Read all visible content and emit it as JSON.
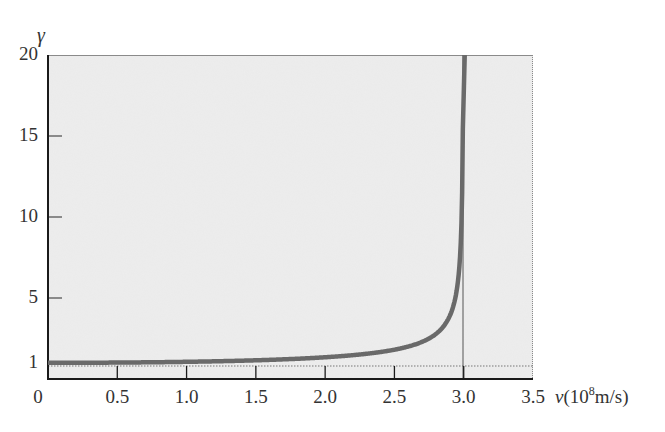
{
  "chart_data": {
    "type": "line",
    "title": "",
    "xlabel": "v(10^8 m/s)",
    "xlabel_parts": {
      "var": "v",
      "open": "(10",
      "exp": "8",
      "rest": "m/s)"
    },
    "ylabel": "γ",
    "xlim": [
      0,
      3.5
    ],
    "ylim": [
      0,
      20
    ],
    "x_ticks": [
      "0",
      "0.5",
      "1.0",
      "1.5",
      "2.0",
      "2.5",
      "3.0",
      "3.5"
    ],
    "y_ticks": [
      "1",
      "5",
      "10",
      "15",
      "20"
    ],
    "grid": false,
    "legend": null,
    "reference_lines": [
      {
        "type": "horizontal",
        "y": 1,
        "style": "dotted"
      },
      {
        "type": "vertical",
        "x": 3.0,
        "style": "thin",
        "label": "c"
      }
    ],
    "series": [
      {
        "name": "gamma = 1/sqrt(1 - v^2/c^2)",
        "x": [
          0,
          0.5,
          1.0,
          1.5,
          2.0,
          2.25,
          2.5,
          2.7,
          2.8,
          2.85,
          2.9,
          2.95,
          2.97,
          2.985,
          2.995
        ],
        "values": [
          1.0,
          1.01,
          1.06,
          1.15,
          1.34,
          1.51,
          1.81,
          2.29,
          2.79,
          3.2,
          3.91,
          5.49,
          7.09,
          10.01,
          17.33
        ]
      }
    ],
    "colors": {
      "background": "#ededed",
      "curve": "#6a6a6a",
      "axis": "#1a1a1a"
    }
  },
  "labels": {
    "y_axis_symbol": "γ",
    "x_tick_labels": [
      "0",
      "0.5",
      "1.0",
      "1.5",
      "2.0",
      "2.5",
      "3.0",
      "3.5"
    ],
    "y_tick_labels": [
      "1",
      "5",
      "10",
      "15",
      "20"
    ],
    "x_unit": {
      "var": "v",
      "open": "(10",
      "exp": "8",
      "rest": "m/s)"
    }
  }
}
